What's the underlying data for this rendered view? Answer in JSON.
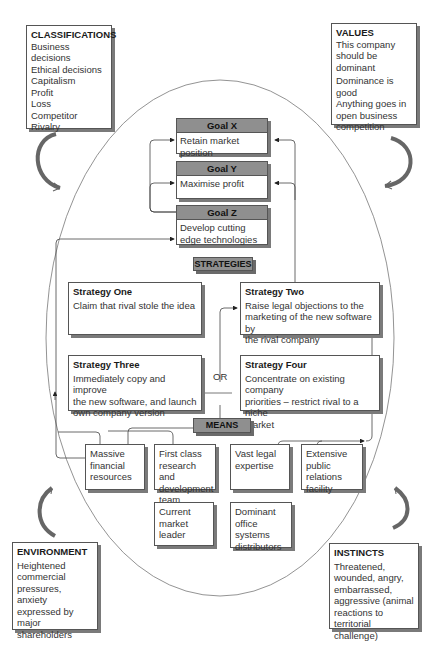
{
  "classifications": {
    "title": "CLASSIFICATIONS",
    "items": [
      "Business decisions",
      "Ethical decisions",
      "Capitalism",
      "Profit",
      "Loss",
      "Competitor",
      "Rivalry"
    ]
  },
  "values": {
    "title": "VALUES",
    "items": [
      "This company",
      "should be",
      "dominant",
      "Dominance is good",
      "Anything goes in",
      "open business",
      "competition"
    ]
  },
  "environment": {
    "title": "ENVIRONMENT",
    "items": [
      "Heightened",
      "commercial",
      "pressures,",
      "anxiety",
      "expressed by",
      "major shareholders"
    ]
  },
  "instincts": {
    "title": "INSTINCTS",
    "items": [
      "Threatened,",
      "wounded, angry,",
      "embarrassed,",
      "aggressive (animal",
      "reactions to",
      "territorial challenge)"
    ]
  },
  "goals": [
    {
      "title": "Goal X",
      "text": "Retain market position"
    },
    {
      "title": "Goal Y",
      "text": "Maximise profit"
    },
    {
      "title": "Goal Z",
      "text": [
        "Develop cutting edge",
        "technologies"
      ]
    }
  ],
  "strategies_label": "STRATEGIES",
  "strategies": [
    {
      "title": "Strategy One",
      "lines": [
        "Claim that rival stole the idea"
      ]
    },
    {
      "title": "Strategy Two",
      "lines": [
        "Raise legal objections to the",
        "marketing of the new software by",
        "the rival company"
      ]
    },
    {
      "title": "Strategy Three",
      "lines": [
        "Immediately copy and improve",
        "the new software, and launch",
        "own company version"
      ]
    },
    {
      "title": "Strategy Four",
      "lines": [
        "Concentrate on existing company",
        "priorities – restrict rival to a niche",
        "market"
      ]
    }
  ],
  "or_label": "OR",
  "means_label": "MEANS",
  "means": [
    {
      "lines": [
        "Massive",
        "financial",
        "resources"
      ]
    },
    {
      "lines": [
        "First class",
        "research and",
        "development",
        "team"
      ]
    },
    {
      "lines": [
        "Vast legal",
        "expertise"
      ]
    },
    {
      "lines": [
        "Extensive",
        "public",
        "relations",
        "facility"
      ]
    },
    {
      "lines": [
        "Current",
        "market",
        "leader"
      ]
    },
    {
      "lines": [
        "Dominant",
        "office",
        "systems",
        "distributors"
      ]
    }
  ],
  "colors": {
    "header_fill": "#8f8f8f",
    "shadow": "#7a7a7a",
    "line": "#555555"
  }
}
